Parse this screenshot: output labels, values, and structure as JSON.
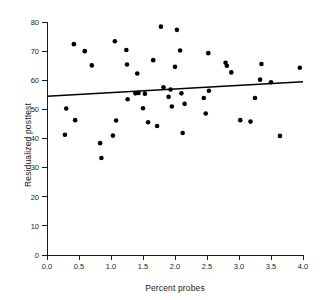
{
  "chart_data": {
    "type": "scatter",
    "title": "",
    "xlabel": "Percent probes",
    "ylabel": "Residualized posttest",
    "xlim": [
      0.0,
      4.0
    ],
    "ylim": [
      0,
      80
    ],
    "xticks": [
      "0.0",
      "0.5",
      "1.0",
      "1.5",
      "2.0",
      "2.5",
      "3.0",
      "3.5",
      "4.0"
    ],
    "xtick_values": [
      0.0,
      0.5,
      1.0,
      1.5,
      2.0,
      2.5,
      3.0,
      3.5,
      4.0
    ],
    "yticks": [
      "0",
      "10",
      "20",
      "30",
      "40",
      "50",
      "60",
      "70",
      "80"
    ],
    "ytick_values": [
      0,
      10,
      20,
      30,
      40,
      50,
      60,
      70,
      80
    ],
    "grid": false,
    "legend": false,
    "marker": "filled-circle",
    "marker_color": "#000000",
    "points": [
      [
        0.28,
        41.3
      ],
      [
        0.3,
        50.3
      ],
      [
        0.42,
        72.4
      ],
      [
        0.44,
        46.3
      ],
      [
        0.59,
        70.0
      ],
      [
        0.7,
        65.1
      ],
      [
        0.83,
        38.4
      ],
      [
        0.85,
        33.3
      ],
      [
        1.03,
        41.0
      ],
      [
        1.06,
        73.4
      ],
      [
        1.08,
        46.2
      ],
      [
        1.24,
        70.4
      ],
      [
        1.25,
        65.4
      ],
      [
        1.26,
        53.5
      ],
      [
        1.38,
        55.5
      ],
      [
        1.41,
        62.3
      ],
      [
        1.43,
        55.6
      ],
      [
        1.5,
        50.4
      ],
      [
        1.53,
        55.4
      ],
      [
        1.58,
        45.6
      ],
      [
        1.66,
        66.9
      ],
      [
        1.72,
        44.3
      ],
      [
        1.78,
        78.4
      ],
      [
        1.82,
        57.6
      ],
      [
        1.9,
        54.3
      ],
      [
        1.93,
        56.8
      ],
      [
        1.95,
        51.0
      ],
      [
        2.0,
        64.6
      ],
      [
        2.03,
        77.3
      ],
      [
        2.08,
        70.2
      ],
      [
        2.1,
        55.5
      ],
      [
        2.12,
        41.9
      ],
      [
        2.15,
        51.9
      ],
      [
        2.45,
        53.9
      ],
      [
        2.48,
        48.6
      ],
      [
        2.52,
        69.3
      ],
      [
        2.53,
        56.4
      ],
      [
        2.79,
        66.0
      ],
      [
        2.81,
        65.0
      ],
      [
        2.88,
        62.7
      ],
      [
        3.02,
        46.3
      ],
      [
        3.18,
        45.8
      ],
      [
        3.25,
        53.9
      ],
      [
        3.33,
        60.2
      ],
      [
        3.35,
        65.6
      ],
      [
        3.5,
        59.3
      ],
      [
        3.64,
        40.9
      ],
      [
        3.95,
        64.3
      ]
    ],
    "trendline": {
      "type": "line",
      "x": [
        0.0,
        4.0
      ],
      "y": [
        54.5,
        59.5
      ],
      "color": "#000000"
    }
  }
}
